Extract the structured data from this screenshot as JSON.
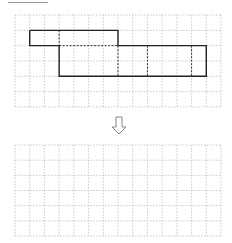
{
  "diagram": {
    "colors": {
      "grid": "#b5b5b5",
      "outline": "#222222",
      "fold": "#333333",
      "arrow": "#777777",
      "rule": "#9a9a9a"
    },
    "top_grid": {
      "x": 15,
      "y": 15,
      "cols": 14,
      "rows": 6,
      "cell_w": 14.714,
      "cell_h": 15.33
    },
    "bottom_grid": {
      "x": 15,
      "y": 145,
      "cols": 14,
      "rows": 6,
      "cell_w": 14.714,
      "cell_h": 15.17
    },
    "shape": {
      "solid_outline_cells": [
        [
          1,
          1
        ],
        [
          7,
          1
        ],
        [
          7,
          2
        ],
        [
          13,
          2
        ],
        [
          13,
          4
        ],
        [
          3,
          4
        ],
        [
          3,
          2
        ],
        [
          1,
          2
        ],
        [
          1,
          1
        ]
      ],
      "fold_lines_cells": [
        [
          [
            3,
            1
          ],
          [
            3,
            2
          ]
        ],
        [
          [
            3,
            2
          ],
          [
            7,
            2
          ]
        ],
        [
          [
            7,
            2
          ],
          [
            7,
            4
          ]
        ],
        [
          [
            9,
            2
          ],
          [
            9,
            4
          ]
        ],
        [
          [
            12,
            2
          ],
          [
            12,
            4
          ]
        ]
      ]
    },
    "arrow": {
      "icon": "down-arrow-icon",
      "direction": "down"
    }
  }
}
